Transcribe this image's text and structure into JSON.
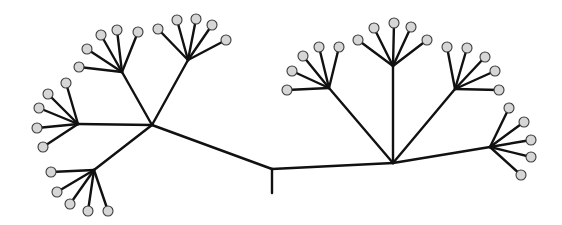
{
  "diagram": {
    "type": "tree",
    "title": "",
    "colors": {
      "background": "#ffffff",
      "edge": "#111111",
      "leaf_fill": "#d6d6d6",
      "leaf_stroke": "#3a3a3a"
    },
    "leaf_radius": 5,
    "root": {
      "x": 272,
      "y": 169,
      "stem_end": {
        "x": 272,
        "y": 193
      }
    },
    "hubs": [
      {
        "id": "left-hub",
        "x": 152,
        "y": 125,
        "parent": "root"
      },
      {
        "id": "right-hub",
        "x": 393,
        "y": 163,
        "parent": "root"
      }
    ],
    "subtrees": [
      {
        "id": "subtree-a",
        "parent": "left-hub",
        "x": 122,
        "y": 72,
        "leaves": [
          [
            79,
            67
          ],
          [
            87,
            49
          ],
          [
            101,
            35
          ],
          [
            117,
            30
          ],
          [
            138,
            32
          ]
        ]
      },
      {
        "id": "subtree-b",
        "parent": "left-hub",
        "x": 188,
        "y": 60,
        "leaves": [
          [
            158,
            29
          ],
          [
            177,
            20
          ],
          [
            196,
            19
          ],
          [
            212,
            25
          ],
          [
            226,
            40
          ]
        ]
      },
      {
        "id": "subtree-c",
        "parent": "left-hub",
        "x": 78,
        "y": 124,
        "leaves": [
          [
            66,
            83
          ],
          [
            48,
            94
          ],
          [
            39,
            108
          ],
          [
            37,
            128
          ],
          [
            43,
            147
          ]
        ]
      },
      {
        "id": "subtree-d",
        "parent": "left-hub",
        "x": 94,
        "y": 170,
        "leaves": [
          [
            51,
            172
          ],
          [
            57,
            192
          ],
          [
            70,
            204
          ],
          [
            88,
            211
          ],
          [
            108,
            211
          ]
        ]
      },
      {
        "id": "subtree-e",
        "parent": "right-hub",
        "x": 329,
        "y": 88,
        "leaves": [
          [
            287,
            90
          ],
          [
            292,
            71
          ],
          [
            303,
            56
          ],
          [
            319,
            47
          ],
          [
            339,
            47
          ]
        ]
      },
      {
        "id": "subtree-f",
        "parent": "right-hub",
        "x": 393,
        "y": 66,
        "leaves": [
          [
            358,
            40
          ],
          [
            374,
            28
          ],
          [
            394,
            23
          ],
          [
            411,
            27
          ],
          [
            427,
            40
          ]
        ]
      },
      {
        "id": "subtree-g",
        "parent": "right-hub",
        "x": 455,
        "y": 89,
        "leaves": [
          [
            447,
            47
          ],
          [
            467,
            48
          ],
          [
            485,
            57
          ],
          [
            495,
            71
          ],
          [
            499,
            90
          ]
        ]
      },
      {
        "id": "subtree-i",
        "parent": "right-hub",
        "x": 490,
        "y": 147,
        "leaves": [
          [
            509,
            108
          ],
          [
            524,
            122
          ],
          [
            531,
            140
          ],
          [
            531,
            157
          ],
          [
            521,
            175
          ]
        ]
      }
    ],
    "counts": {
      "hubs": 2,
      "subtrees": 8,
      "leaves": 40
    }
  }
}
